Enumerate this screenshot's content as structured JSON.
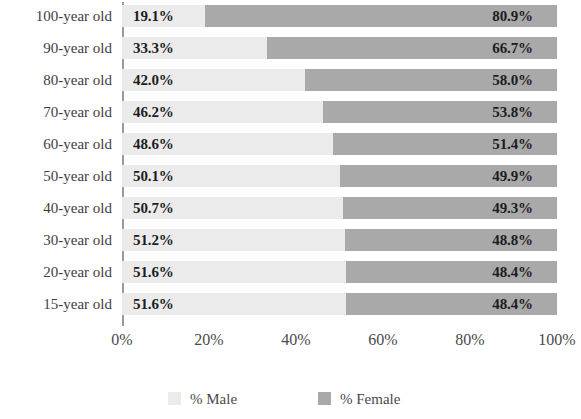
{
  "chart_data": {
    "type": "bar",
    "subtype": "stacked-horizontal-100-percent",
    "title": "",
    "xlabel": "",
    "ylabel": "",
    "xlim": [
      0,
      100
    ],
    "grid": false,
    "legend_position": "bottom",
    "categories": [
      "100-year old",
      "90-year old",
      "80-year old",
      "70-year old",
      "60-year old",
      "50-year old",
      "40-year old",
      "30-year old",
      "20-year old",
      "15-year old"
    ],
    "series": [
      {
        "name": "% Male",
        "color": "#ebebeb",
        "values": [
          19.1,
          33.3,
          42.0,
          46.2,
          48.6,
          50.1,
          50.7,
          51.2,
          51.6,
          51.6
        ],
        "labels": [
          "19.1%",
          "33.3%",
          "42.0%",
          "46.2%",
          "48.6%",
          "50.1%",
          "50.7%",
          "51.2%",
          "51.6%",
          "51.6%"
        ]
      },
      {
        "name": "% Female",
        "color": "#a9a9a9",
        "values": [
          80.9,
          66.7,
          58.0,
          53.8,
          51.4,
          49.9,
          49.3,
          48.8,
          48.4,
          48.4
        ],
        "labels": [
          "80.9%",
          "66.7%",
          "58.0%",
          "53.8%",
          "51.4%",
          "49.9%",
          "49.3%",
          "48.8%",
          "48.4%",
          "48.4%"
        ]
      }
    ],
    "xticks": [
      0,
      20,
      40,
      60,
      80,
      100
    ],
    "xtick_labels": [
      "0%",
      "20%",
      "40%",
      "60%",
      "80%",
      "100%"
    ]
  },
  "legend": {
    "items": [
      {
        "label": "% Male",
        "color": "#ebebeb"
      },
      {
        "label": "% Female",
        "color": "#a9a9a9"
      }
    ]
  }
}
